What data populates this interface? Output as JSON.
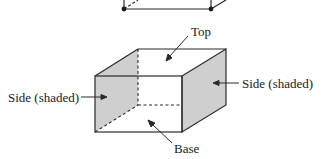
{
  "figure": {
    "type": "box-diagram",
    "labels": {
      "top": "Top",
      "side_left": "Side (shaded)",
      "side_right": "Side (shaded)",
      "base": "Base"
    },
    "colors": {
      "stroke": "#2a2a2a",
      "shade": "#cfcfcf",
      "background": "#ffffff",
      "dot": "#1a1a1a"
    }
  }
}
